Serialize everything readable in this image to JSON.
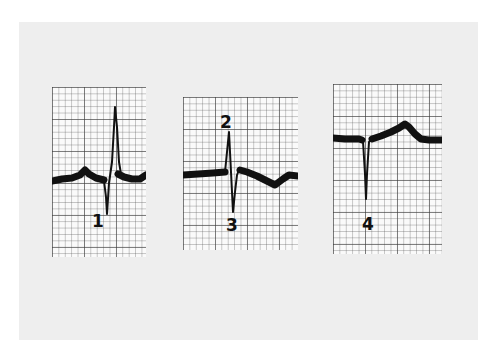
{
  "figure": {
    "description": "Three ECG waveform strips on grid paper with numbered points",
    "colors": {
      "background": "#ffffff",
      "card": "#eeeeee",
      "paper": "#fafafa",
      "grid": "#555555",
      "trace": "#111111"
    },
    "panels": [
      {
        "id": "panel-1",
        "labels": [
          {
            "text": "1",
            "point": "S-wave nadir"
          }
        ]
      },
      {
        "id": "panel-2",
        "labels": [
          {
            "text": "2",
            "point": "R-wave peak"
          },
          {
            "text": "3",
            "point": "S-wave nadir"
          }
        ]
      },
      {
        "id": "panel-3",
        "labels": [
          {
            "text": "4",
            "point": "Q/S-wave nadir"
          }
        ]
      }
    ]
  }
}
